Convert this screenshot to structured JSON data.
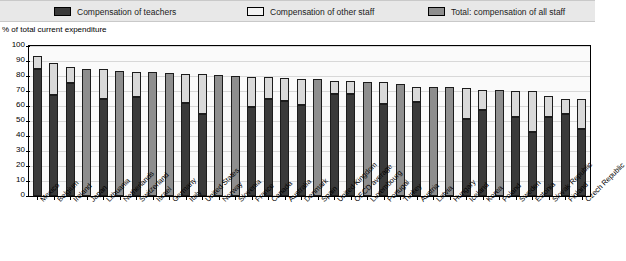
{
  "legend": {
    "items": [
      {
        "label": "Compensation of teachers",
        "icon": "legend-swatch-dark",
        "color": "#3a3a3a"
      },
      {
        "label": "Compensation of other staff",
        "icon": "legend-swatch-light",
        "color": "#f2f2f2"
      },
      {
        "label": "Total: compensation of all staff",
        "icon": "legend-swatch-gray",
        "color": "#8e8e8e"
      }
    ]
  },
  "axis_caption": "% of total current expenditure",
  "chart_data": {
    "type": "bar",
    "title": "",
    "subtitle": "",
    "xlabel": "",
    "ylabel": "% of total current expenditure",
    "ylim": [
      0,
      100
    ],
    "yticks": [
      0,
      10,
      20,
      30,
      40,
      50,
      60,
      70,
      80,
      90,
      100
    ],
    "grid": true,
    "legend_position": "top",
    "stacked": true,
    "note": "Bars with no teacher/other breakdown are drawn as a single gray 'total' bar.",
    "categories": [
      "Mexico",
      "Belgium",
      "Ireland",
      "Japan",
      "Lithuania",
      "Netherlands",
      "Switzerland",
      "Israel",
      "Germany",
      "Italy",
      "United States",
      "Norway",
      "Slovenia",
      "France",
      "Canada",
      "Australia",
      "Denmark",
      "Spain",
      "United Kingdom",
      "OECD average",
      "Luxembourg",
      "Portugal",
      "Turkey",
      "Austria",
      "Latvia",
      "Hungary",
      "Iceland",
      "Korea",
      "Poland",
      "Sweden",
      "Estonia",
      "Slovak Republic",
      "Finland",
      "Czech Republic"
    ],
    "series": [
      {
        "name": "Compensation of teachers",
        "values": [
          84.5,
          67.5,
          75.5,
          null,
          65.0,
          null,
          66.0,
          null,
          null,
          62.0,
          55.0,
          null,
          null,
          59.5,
          65.0,
          63.5,
          61.0,
          null,
          68.0,
          68.0,
          null,
          61.5,
          null,
          62.5,
          null,
          null,
          51.5,
          57.5,
          null,
          53.0,
          43.0,
          52.5,
          55.0,
          45.0
        ]
      },
      {
        "name": "Compensation of other staff",
        "values": [
          9.0,
          21.0,
          10.5,
          null,
          19.5,
          null,
          17.0,
          null,
          null,
          19.5,
          26.5,
          null,
          null,
          20.0,
          14.5,
          15.0,
          17.0,
          null,
          9.0,
          8.5,
          null,
          14.5,
          null,
          10.5,
          null,
          null,
          20.5,
          13.0,
          null,
          17.0,
          27.0,
          14.5,
          10.0,
          20.0
        ]
      },
      {
        "name": "Total: compensation of all staff",
        "values": [
          93.5,
          88.5,
          86.0,
          85.0,
          84.5,
          83.5,
          83.0,
          82.5,
          82.0,
          81.5,
          81.5,
          81.0,
          80.0,
          79.5,
          79.5,
          78.5,
          78.0,
          78.0,
          77.0,
          76.5,
          76.0,
          76.0,
          74.5,
          73.0,
          72.5,
          72.5,
          72.0,
          70.5,
          70.5,
          70.0,
          70.0,
          67.0,
          65.0,
          65.0
        ]
      }
    ]
  }
}
